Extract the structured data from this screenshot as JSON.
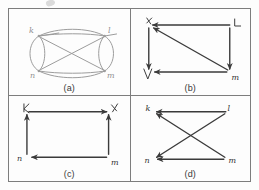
{
  "figure": {
    "kind": "hand-drawn-graph-panels",
    "panel_count": 4,
    "ink_color": "#3b3b3b",
    "faint_ink_color": "#9c9c9c",
    "border_color": "#7d7d7d",
    "background": "#fdfdfd"
  },
  "panels": [
    {
      "id": "a",
      "caption": "(a)",
      "description": "oval/ellipse multigraph with crossing chords",
      "vertices": [
        {
          "label": "k",
          "x": 30,
          "y": 27
        },
        {
          "label": "l",
          "x": 96,
          "y": 27
        },
        {
          "label": "n",
          "x": 30,
          "y": 62
        },
        {
          "label": "m",
          "x": 96,
          "y": 62
        }
      ],
      "edges": [
        {
          "from": "k",
          "to": "l",
          "style": "curve-up"
        },
        {
          "from": "n",
          "to": "m",
          "style": "curve-down"
        },
        {
          "from": "k",
          "to": "n",
          "style": "curve-left-loop"
        },
        {
          "from": "l",
          "to": "m",
          "style": "curve-right-loop"
        },
        {
          "from": "k",
          "to": "m",
          "style": "diagonal"
        },
        {
          "from": "l",
          "to": "n",
          "style": "diagonal"
        }
      ]
    },
    {
      "id": "b",
      "caption": "(b)",
      "description": "directed rectangle with one diagonal",
      "vertices": [
        {
          "label": "k",
          "x": 18,
          "y": 16
        },
        {
          "label": "l",
          "x": 100,
          "y": 16
        },
        {
          "label": "v",
          "x": 18,
          "y": 63
        },
        {
          "label": "m",
          "x": 100,
          "y": 63
        }
      ],
      "edges": [
        {
          "from": "l",
          "to": "k",
          "directed": true
        },
        {
          "from": "k",
          "to": "v",
          "directed": true
        },
        {
          "from": "m",
          "to": "v",
          "directed": true
        },
        {
          "from": "l",
          "to": "m",
          "directed": true
        },
        {
          "from": "m",
          "to": "k",
          "directed": true,
          "style": "diagonal"
        }
      ]
    },
    {
      "id": "c",
      "caption": "(c)",
      "description": "directed rectangle cycle, no diagonal",
      "vertices": [
        {
          "label": "k",
          "x": 18,
          "y": 16
        },
        {
          "label": "l",
          "x": 100,
          "y": 16
        },
        {
          "label": "n",
          "x": 18,
          "y": 62
        },
        {
          "label": "m",
          "x": 100,
          "y": 62
        }
      ],
      "edges": [
        {
          "from": "k",
          "to": "l",
          "directed": true
        },
        {
          "from": "n",
          "to": "k",
          "directed": true
        },
        {
          "from": "m",
          "to": "n",
          "directed": true
        },
        {
          "from": "m",
          "to": "l",
          "directed": true
        }
      ]
    },
    {
      "id": "d",
      "caption": "(d)",
      "description": "bowtie / crossed edges between two horizontal pairs",
      "vertices": [
        {
          "label": "k",
          "x": 22,
          "y": 16
        },
        {
          "label": "l",
          "x": 96,
          "y": 16
        },
        {
          "label": "n",
          "x": 22,
          "y": 64
        },
        {
          "label": "m",
          "x": 96,
          "y": 64
        }
      ],
      "edges": [
        {
          "from": "l",
          "to": "k",
          "directed": true
        },
        {
          "from": "m",
          "to": "n",
          "directed": true
        },
        {
          "from": "l",
          "to": "n",
          "directed": true,
          "style": "diagonal"
        },
        {
          "from": "m",
          "to": "k",
          "directed": true,
          "style": "diagonal"
        }
      ]
    }
  ]
}
